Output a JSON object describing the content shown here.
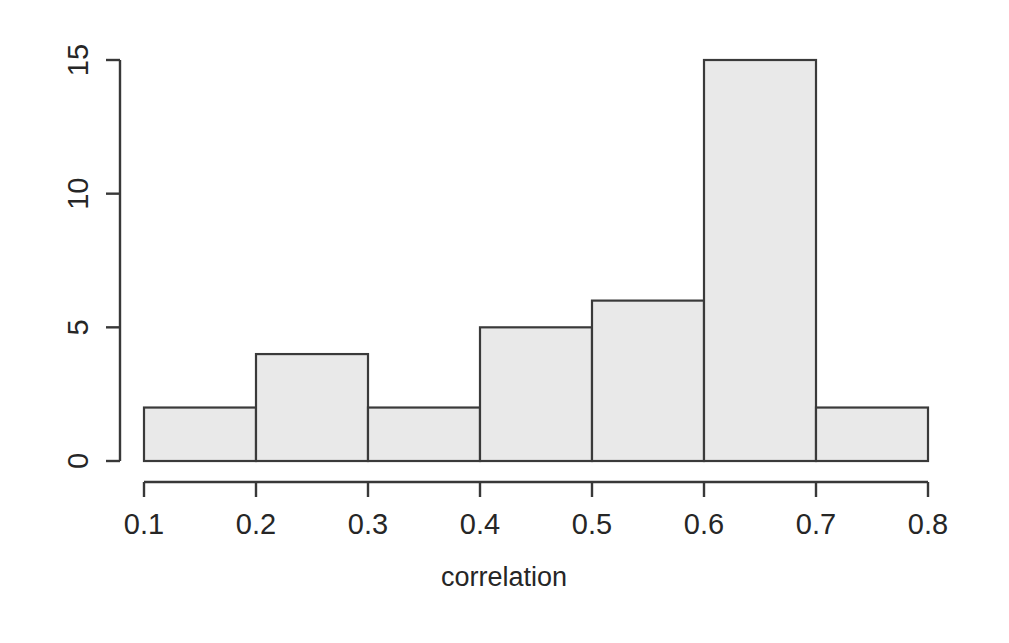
{
  "chart_data": {
    "type": "bar",
    "title": "",
    "subtitle": "",
    "xlabel": "correlation",
    "ylabel": "",
    "categories": [
      "0.1-0.2",
      "0.2-0.3",
      "0.3-0.4",
      "0.4-0.5",
      "0.5-0.6",
      "0.6-0.7",
      "0.7-0.8"
    ],
    "bin_edges": [
      0.1,
      0.2,
      0.3,
      0.4,
      0.5,
      0.6,
      0.7,
      0.8
    ],
    "values": [
      2,
      4,
      2,
      5,
      6,
      15,
      2
    ],
    "bin_width": 0.1,
    "xlim": [
      0.1,
      0.8
    ],
    "ylim": [
      0,
      15
    ],
    "x_ticks": [
      0.1,
      0.2,
      0.3,
      0.4,
      0.5,
      0.6,
      0.7,
      0.8
    ],
    "x_tick_labels": [
      "0.1",
      "0.2",
      "0.3",
      "0.4",
      "0.5",
      "0.6",
      "0.7",
      "0.8"
    ],
    "y_ticks": [
      0,
      5,
      10,
      15
    ],
    "y_tick_labels": [
      "0",
      "5",
      "10",
      "15"
    ],
    "grid": false,
    "legend": false,
    "legend_position": "none",
    "bar_fill_color": "#e9e9e9",
    "bar_edge_color": "#3a3a3a",
    "axis_color": "#383838",
    "background_color": "#ffffff",
    "y_tick_label_rotation": 90,
    "style": "r-base-graphics-histogram"
  }
}
